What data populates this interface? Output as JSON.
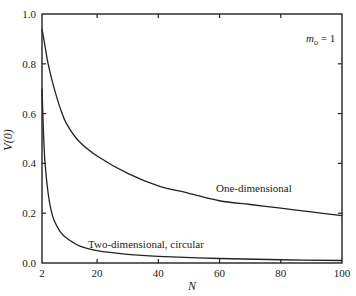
{
  "chart_data": {
    "type": "line",
    "title": "",
    "xlabel": "N",
    "ylabel": "V(0)",
    "xlim": [
      2,
      100
    ],
    "ylim": [
      0.0,
      1.0
    ],
    "grid": false,
    "xticks": [
      2,
      20,
      40,
      60,
      80,
      100
    ],
    "xtick_labels": [
      "2",
      "20",
      "40",
      "60",
      "80",
      "100"
    ],
    "yticks": [
      0.0,
      0.2,
      0.4,
      0.6,
      0.8,
      1.0
    ],
    "ytick_labels": [
      "0.0",
      "0.2",
      "0.4",
      "0.6",
      "0.8",
      "1.0"
    ],
    "series": [
      {
        "name": "One-dimensional",
        "x": [
          2,
          3,
          4,
          6,
          8,
          10,
          14,
          20,
          30,
          40,
          50,
          60,
          70,
          80,
          90,
          100
        ],
        "y": [
          0.94,
          0.87,
          0.8,
          0.7,
          0.62,
          0.56,
          0.49,
          0.43,
          0.36,
          0.31,
          0.28,
          0.25,
          0.235,
          0.22,
          0.205,
          0.19
        ]
      },
      {
        "name": "Two-dimensional, circular",
        "x": [
          2,
          2.5,
          3,
          4,
          5,
          6,
          8,
          10,
          14,
          20,
          30,
          40,
          60,
          80,
          100
        ],
        "y": [
          0.7,
          0.52,
          0.4,
          0.28,
          0.21,
          0.17,
          0.125,
          0.1,
          0.07,
          0.05,
          0.035,
          0.027,
          0.018,
          0.013,
          0.01
        ]
      }
    ],
    "annotations": [
      {
        "text": "One-dimensional",
        "at": [
          62,
          0.3
        ]
      },
      {
        "text": "Two-dimensional, circular",
        "at": [
          55,
          0.06
        ]
      },
      {
        "text_main": "m",
        "text_sub": "o",
        "text_rest": " = 1",
        "at": [
          88,
          0.9
        ]
      }
    ]
  }
}
